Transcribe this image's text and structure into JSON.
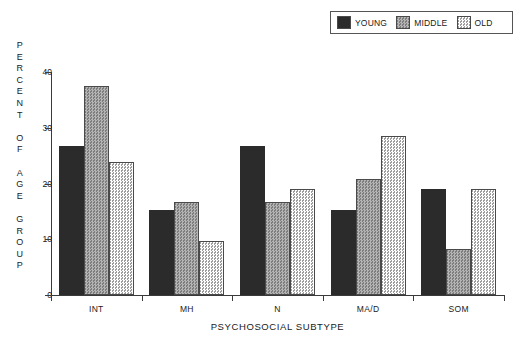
{
  "chart_data": {
    "type": "bar",
    "title": "",
    "xlabel": "PSYCHOSOCIAL SUBTYPE",
    "ylabel": "PERCENT OF AGE GROUP",
    "categories": [
      "INT",
      "MH",
      "N",
      "MA/D",
      "SOM"
    ],
    "series": [
      {
        "name": "YOUNG",
        "values": [
          26.8,
          15.3,
          26.8,
          15.3,
          19.0
        ],
        "color": "#2b2b2b",
        "pattern": "solid-dark"
      },
      {
        "name": "MIDDLE",
        "values": [
          37.5,
          16.7,
          16.7,
          20.8,
          8.3
        ],
        "color": "#9a9a9a",
        "pattern": "checker-medium"
      },
      {
        "name": "OLD",
        "values": [
          23.8,
          9.6,
          19.0,
          28.6,
          19.0
        ],
        "color": "#f2f2f2",
        "pattern": "checker-light"
      }
    ],
    "ylim": [
      0,
      40
    ],
    "yticks": [
      0,
      10,
      20,
      30,
      40
    ],
    "ytick_labels": [
      "0",
      "10",
      "20",
      "30",
      "40"
    ],
    "grid": false,
    "legend_position": "top-right"
  },
  "legend": {
    "entries": [
      {
        "label": "YOUNG"
      },
      {
        "label": "MIDDLE"
      },
      {
        "label": "OLD"
      }
    ]
  },
  "axes": {
    "y_title_letters": [
      "P",
      "E",
      "R",
      "C",
      "E",
      "N",
      "T",
      "",
      "O",
      "F",
      "",
      "A",
      "G",
      "E",
      "",
      "G",
      "R",
      "O",
      "U",
      "P"
    ],
    "x_title": "PSYCHOSOCIAL SUBTYPE"
  }
}
